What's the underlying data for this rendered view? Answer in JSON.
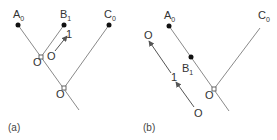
{
  "panels": [
    {
      "caption": "(a)",
      "points": {
        "A": {
          "letter": "A",
          "sub": "0"
        },
        "B": {
          "letter": "B",
          "sub": "1"
        },
        "C": {
          "letter": "C",
          "sub": "0"
        },
        "O_upper": {
          "letter": "O"
        },
        "O_lower": {
          "letter": "O"
        }
      },
      "arrow": {
        "from": "O",
        "to": "1"
      }
    },
    {
      "caption": "(b)",
      "points": {
        "A": {
          "letter": "A",
          "sub": "0"
        },
        "B": {
          "letter": "B",
          "sub": "1"
        },
        "C": {
          "letter": "C",
          "sub": "0"
        },
        "O_vertex": {
          "letter": "O"
        }
      },
      "arrows": {
        "start": "O",
        "mid": "1",
        "end": "O"
      }
    }
  ],
  "colors": {
    "line": "#8a8a8a",
    "arrow": "#555555",
    "dot": "#111111",
    "text": "#333333"
  }
}
